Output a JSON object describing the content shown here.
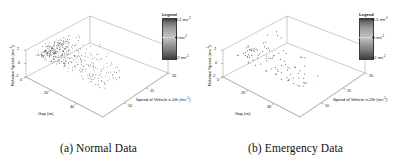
{
  "figure": {
    "panels": [
      {
        "id": "a",
        "caption": "(a) Normal Data",
        "legend": {
          "title": "Legend",
          "ticks": [
            "0.2 ms",
            "0 ms",
            "-2 ms"
          ],
          "tick_exponents": [
            "-2",
            "-2",
            "-2"
          ],
          "tick_values": [
            0.2,
            0,
            -2
          ],
          "colormap": "grayscale"
        },
        "axes": {
          "x": {
            "label": "Gap (m)",
            "ticks": [
              "0",
              "20",
              "40"
            ],
            "values": [
              0,
              20,
              40
            ]
          },
          "y": {
            "label": "Relative Speed (ms",
            "label_exponent": "-1",
            "ticks": [
              "2",
              "0",
              "-2"
            ],
            "values": [
              2,
              0,
              -2
            ]
          },
          "z": {
            "label": "Speed of Vehicle n-2th (ms",
            "label_exponent": "-1",
            "ticks": [
              "10",
              "15",
              "20"
            ],
            "values": [
              10,
              15,
              20
            ]
          }
        }
      },
      {
        "id": "b",
        "caption": "(b) Emergency Data",
        "legend": {
          "title": "Legend",
          "ticks": [
            "0.5 ms",
            "0 ms",
            "-2 ms"
          ],
          "tick_exponents": [
            "-2",
            "-2",
            "-2"
          ],
          "tick_values": [
            0.5,
            0,
            -2
          ],
          "colormap": "grayscale"
        },
        "axes": {
          "x": {
            "label": "Gap (m)",
            "ticks": [
              "0",
              "20",
              "30"
            ],
            "values": [
              0,
              20,
              30
            ]
          },
          "y": {
            "label": "Relative Speed (ms",
            "label_exponent": "-1",
            "ticks": [
              "2",
              "0",
              "-2"
            ],
            "values": [
              2,
              0,
              -2
            ]
          },
          "z": {
            "label": "Speed of Vehicle n-2th (ms",
            "label_exponent": "-1",
            "ticks": [
              "10",
              "15",
              "20"
            ],
            "values": [
              10,
              15,
              20
            ]
          }
        }
      }
    ]
  },
  "chart_data": [
    {
      "type": "scatter",
      "title": "(a) Normal Data",
      "projection": "3d",
      "xlabel": "Gap (m)",
      "ylabel": "Relative Speed (ms^-1)",
      "zlabel": "Speed of Vehicle n-2th (ms^-1)",
      "colorbar_label": "Legend",
      "colorbar_unit": "ms^-2",
      "clim": [
        -2,
        0.2
      ],
      "xlim": [
        0,
        50
      ],
      "ylim": [
        -3,
        3
      ],
      "zlim": [
        8,
        22
      ],
      "grid": false,
      "n_points": 520,
      "density": "dense-cluster",
      "cluster_center": {
        "gap": 15,
        "relative_speed": 0.2,
        "speed": 13
      },
      "marker": "point",
      "marker_color": "#3a3a3a",
      "description": "Dense cluster of normal car-following observations concentrated at small gaps and near-zero relative speed, thinning out toward larger gaps."
    },
    {
      "type": "scatter",
      "title": "(b) Emergency Data",
      "projection": "3d",
      "xlabel": "Gap (m)",
      "ylabel": "Relative Speed (ms^-1)",
      "zlabel": "Speed of Vehicle n-2th (ms^-1)",
      "colorbar_label": "Legend",
      "colorbar_unit": "ms^-2",
      "clim": [
        -2,
        0.5
      ],
      "xlim": [
        0,
        40
      ],
      "ylim": [
        -3,
        3
      ],
      "zlim": [
        8,
        22
      ],
      "grid": false,
      "n_points": 150,
      "density": "sparse-cluster",
      "cluster_center": {
        "gap": 12,
        "relative_speed": 0.0,
        "speed": 13
      },
      "marker": "point",
      "marker_color": "#3a3a3a",
      "description": "Sparser set of emergency braking observations, clustered at small gaps with scattered outliers at larger gaps."
    }
  ]
}
